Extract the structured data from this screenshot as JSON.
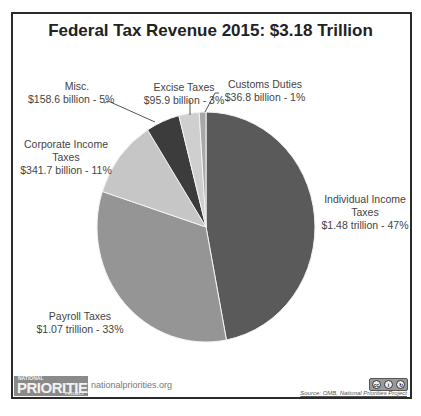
{
  "chart_data": {
    "type": "pie",
    "title": "Federal Tax Revenue 2015: $3.18 Trillion",
    "start_angle_deg": 0,
    "direction": "clockwise",
    "slices": [
      {
        "name": "Individual Income Taxes",
        "amount": "$1.48 trillion",
        "value": 1480,
        "percent": 47,
        "color": "#5a5a5a"
      },
      {
        "name": "Payroll Taxes",
        "amount": "$1.07 trillion",
        "value": 1070,
        "percent": 33,
        "color": "#959595"
      },
      {
        "name": "Corporate Income Taxes",
        "amount": "$341.7 billion",
        "value": 341.7,
        "percent": 11,
        "color": "#c6c6c6"
      },
      {
        "name": "Misc.",
        "amount": "$158.6 billion",
        "value": 158.6,
        "percent": 5,
        "color": "#3c3c3c"
      },
      {
        "name": "Excise Taxes",
        "amount": "$95.9 billion",
        "value": 95.9,
        "percent": 3,
        "color": "#cfcfcf"
      },
      {
        "name": "Customs Duties",
        "amount": "$36.8 billion",
        "value": 36.8,
        "percent": 1,
        "color": "#a8a8a8"
      }
    ],
    "units": "USD"
  },
  "labels": {
    "individual": {
      "line1": "Individual Income",
      "line2": "Taxes",
      "line3": "$1.48 trillion - 47%"
    },
    "payroll": {
      "line1": "Payroll Taxes",
      "line2": "$1.07 trillion - 33%"
    },
    "corporate": {
      "line1": "Corporate Income",
      "line2": "Taxes",
      "line3": "$341.7 billion - 11%"
    },
    "misc": {
      "line1": "Misc.",
      "line2": "$158.6 billion - 5%"
    },
    "excise": {
      "line1": "Excise Taxes",
      "line2": "$95.9 billion - 3%"
    },
    "customs": {
      "line1": "Customs Duties",
      "line2": "$36.8 billion - 1%"
    }
  },
  "footer": {
    "logo_top": "NATIONAL",
    "logo_main": "PRIORITIES",
    "logo_bottom": "PROJECT",
    "site": "nationalpriorities.org",
    "license": "cc by",
    "source": "Source: OMB, National Priorities Project"
  }
}
